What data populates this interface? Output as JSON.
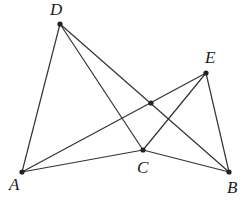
{
  "diagram": {
    "type": "geometry-figure",
    "points": {
      "A": {
        "label": "A",
        "x": 22,
        "y": 172,
        "label_x": 9,
        "label_y": 190
      },
      "B": {
        "label": "B",
        "x": 229,
        "y": 172,
        "label_x": 227,
        "label_y": 193
      },
      "C": {
        "label": "C",
        "x": 143,
        "y": 150,
        "label_x": 137,
        "label_y": 173
      },
      "D": {
        "label": "D",
        "x": 60,
        "y": 24,
        "label_x": 50,
        "label_y": 15
      },
      "E": {
        "label": "E",
        "x": 206,
        "y": 73,
        "label_x": 205,
        "label_y": 63
      },
      "P": {
        "label": "",
        "x": 151,
        "y": 103
      }
    },
    "segments": [
      [
        "D",
        "A"
      ],
      [
        "D",
        "C"
      ],
      [
        "D",
        "B"
      ],
      [
        "E",
        "A"
      ],
      [
        "E",
        "C"
      ],
      [
        "E",
        "B"
      ],
      [
        "A",
        "C"
      ],
      [
        "C",
        "B"
      ]
    ],
    "colors": {
      "line": "#333333",
      "point": "#222222",
      "label": "#1a1a1a",
      "background": "#ffffff"
    }
  }
}
